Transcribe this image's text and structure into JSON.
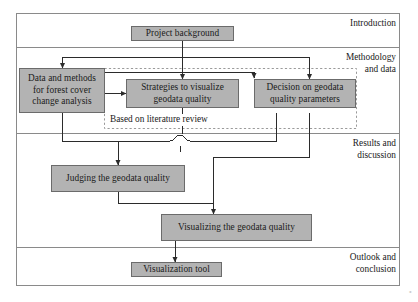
{
  "figure": {
    "type": "flowchart",
    "orientation": "top-to-bottom",
    "corner_mark": "⁺"
  },
  "frame": {
    "outer_border_color": "#8a8a8a",
    "divider_color": "#8a8a8a"
  },
  "style": {
    "node_fill": "#b3b3b3",
    "node_stroke": "#6b6b6b",
    "connector_color": "#2b2b2b",
    "dashed_group_color": "#9a9a9a",
    "text_color": "#1a1a1a",
    "background": "#ffffff"
  },
  "phases": [
    {
      "id": "introduction",
      "label": "Introduction"
    },
    {
      "id": "methodology",
      "label": "Methodology\nand data"
    },
    {
      "id": "results",
      "label": "Results and\ndiscussion"
    },
    {
      "id": "outlook",
      "label": "Outlook and\nconclusion"
    }
  ],
  "nodes": [
    {
      "id": "project-background",
      "label": "Project background",
      "phase": "introduction"
    },
    {
      "id": "data-and-methods",
      "label": "Data and methods\nfor forest cover\nchange analysis",
      "phase": "methodology"
    },
    {
      "id": "strategies-to-visualize",
      "label": "Strategies to visualize\ngeodata quality",
      "phase": "methodology"
    },
    {
      "id": "decision-on-parameters",
      "label": "Decision on geodata\nquality parameters",
      "phase": "methodology"
    },
    {
      "id": "judging-quality",
      "label": "Judging the geodata quality",
      "phase": "results"
    },
    {
      "id": "visualizing-quality",
      "label": "Visualizing the geodata quality",
      "phase": "results"
    },
    {
      "id": "visualization-tool",
      "label": "Visualization tool",
      "phase": "outlook"
    }
  ],
  "groups": [
    {
      "id": "literature-review-group",
      "label": "Based on literature review",
      "style": "dashed"
    }
  ],
  "edges": [
    {
      "from": "project-background",
      "to": "data-and-methods"
    },
    {
      "from": "project-background",
      "to": "strategies-to-visualize"
    },
    {
      "from": "project-background",
      "to": "decision-on-parameters"
    },
    {
      "from": "data-and-methods",
      "to": "strategies-to-visualize"
    },
    {
      "from": "strategies-to-visualize",
      "to": "decision-on-parameters"
    },
    {
      "from": "data-and-methods",
      "to": "judging-quality"
    },
    {
      "from": "decision-on-parameters",
      "to": "judging-quality"
    },
    {
      "from": "strategies-to-visualize",
      "to": "visualizing-quality"
    },
    {
      "from": "judging-quality",
      "to": "visualizing-quality"
    },
    {
      "from": "decision-on-parameters",
      "to": "visualizing-quality"
    },
    {
      "from": "visualizing-quality",
      "to": "visualization-tool"
    }
  ]
}
